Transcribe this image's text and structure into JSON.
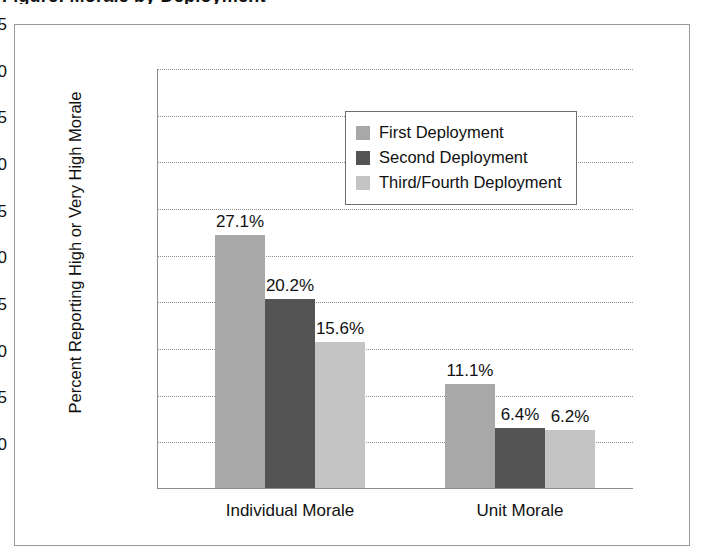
{
  "figure": {
    "title_partial": "Figure: Morale by Deployment"
  },
  "chart_data": {
    "type": "bar",
    "title": "Figure: Morale by Deployment",
    "xlabel": "",
    "ylabel": "Percent Reporting High or Very High Morale",
    "ylim": [
      0,
      45
    ],
    "ytick_step": 5,
    "yticks": [
      "45",
      "40",
      "35",
      "30",
      "25",
      "20",
      "15",
      "10",
      "5",
      "0"
    ],
    "grid": true,
    "legend_position": "upper center",
    "categories": [
      "Individual Morale",
      "Unit Morale"
    ],
    "series": [
      {
        "name": "First Deployment",
        "color": "#a8a8a8",
        "values": [
          27.1,
          15.6
        ],
        "labels": [
          "27.1%",
          "11.1%"
        ]
      },
      {
        "name": "Second Deployment",
        "color": "#545454",
        "values": [
          20.2,
          6.4
        ],
        "labels": [
          "20.2%",
          "6.4%"
        ]
      },
      {
        "name": "Third/Fourth Deployment",
        "color": "#c4c4c4",
        "values": [
          15.6,
          6.2
        ],
        "labels": [
          "15.6%",
          "6.2%"
        ]
      }
    ],
    "data_points": [
      {
        "category": "Individual Morale",
        "series": "First Deployment",
        "value": 27.1,
        "label": "27.1%"
      },
      {
        "category": "Individual Morale",
        "series": "Second Deployment",
        "value": 20.2,
        "label": "20.2%"
      },
      {
        "category": "Individual Morale",
        "series": "Third/Fourth Deployment",
        "value": 15.6,
        "label": "15.6%"
      },
      {
        "category": "Unit Morale",
        "series": "First Deployment",
        "value": 11.1,
        "label": "11.1%"
      },
      {
        "category": "Unit Morale",
        "series": "Second Deployment",
        "value": 6.4,
        "label": "6.4%"
      },
      {
        "category": "Unit Morale",
        "series": "Third/Fourth Deployment",
        "value": 6.2,
        "label": "6.2%"
      }
    ]
  },
  "colors": {
    "series_1": "#a8a8a8",
    "series_2": "#545454",
    "series_3": "#c4c4c4",
    "axis": "#8e8e8e",
    "grid": "#8f8f8f",
    "frame": "#9a9a9a",
    "text": "#111111",
    "background": "#ffffff"
  }
}
